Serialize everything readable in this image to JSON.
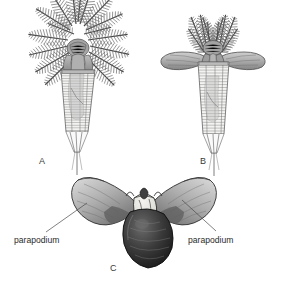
{
  "figure": {
    "background_color": "#ffffff",
    "ink_color": "#3a3a3a",
    "panels": [
      {
        "id": "A",
        "letter": "A",
        "letter_x": 39,
        "letter_y": 164,
        "description": "lateral view of worm with spreading plumose radioles and segmented tapering tube"
      },
      {
        "id": "B",
        "letter": "B",
        "letter_x": 200,
        "letter_y": 164,
        "description": "view of worm with upright paired radiole plumes and outspread lateral parapodial lobes"
      },
      {
        "id": "C",
        "letter": "C",
        "letter_x": 110,
        "letter_y": 271,
        "description": "anterior frontal view showing paired wing-like parapodia flanking dark central body"
      }
    ],
    "callouts": [
      {
        "id": "parapodium-left",
        "label": "parapodium",
        "label_x": 14,
        "label_y": 243,
        "leader_from_x": 46,
        "leader_from_y": 232,
        "leader_to_x": 87,
        "leader_to_y": 203
      },
      {
        "id": "parapodium-right",
        "label": "parapodium",
        "label_x": 188,
        "label_y": 243,
        "leader_from_x": 216,
        "leader_from_y": 231,
        "leader_to_x": 182,
        "leader_to_y": 200
      }
    ],
    "palette": {
      "line": "#4a4a4a",
      "mid_gray": "#9a9a9a",
      "light_gray": "#c9c9c9",
      "pale_gray": "#e2e2e2",
      "dark_gray": "#4f4f4f",
      "near_black": "#1e1e1e",
      "highlight": "#f0efeb"
    }
  }
}
